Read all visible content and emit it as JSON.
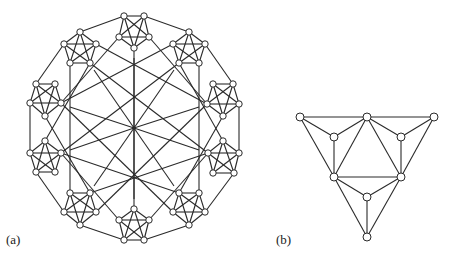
{
  "figure": {
    "panels": [
      {
        "id": "a",
        "label": "(a)",
        "description": "Graph with eight K5 pentagon clusters arranged on a circle, joined by an outer cycle, long chords and twelve spokes meeting at a central vertex",
        "center": [
          134,
          128
        ],
        "clusters": [
          {
            "name": "top",
            "vertices": [
              [
                124,
                16
              ],
              [
                144,
                16
              ],
              [
                119,
                37
              ],
              [
                149,
                37
              ],
              [
                134,
                48
              ]
            ]
          },
          {
            "name": "top-right",
            "vertices": [
              [
                189,
                32
              ],
              [
                173,
                44
              ],
              [
                205,
                44
              ],
              [
                179,
                63
              ],
              [
                199,
                63
              ]
            ]
          },
          {
            "name": "right-upper",
            "vertices": [
              [
                213,
                84
              ],
              [
                233,
                84
              ],
              [
                207,
                104
              ],
              [
                239,
                104
              ],
              [
                223,
                116
              ]
            ]
          },
          {
            "name": "right-lower",
            "vertices": [
              [
                223,
                141
              ],
              [
                208,
                153
              ],
              [
                239,
                153
              ],
              [
                213,
                173
              ],
              [
                234,
                173
              ]
            ]
          },
          {
            "name": "bottom-right",
            "vertices": [
              [
                179,
                193
              ],
              [
                199,
                193
              ],
              [
                173,
                212
              ],
              [
                205,
                212
              ],
              [
                189,
                225
              ]
            ]
          },
          {
            "name": "bottom",
            "vertices": [
              [
                134,
                209
              ],
              [
                119,
                220
              ],
              [
                149,
                220
              ],
              [
                124,
                240
              ],
              [
                144,
                240
              ]
            ]
          },
          {
            "name": "bottom-left",
            "vertices": [
              [
                70,
                193
              ],
              [
                90,
                193
              ],
              [
                64,
                212
              ],
              [
                96,
                212
              ],
              [
                80,
                225
              ]
            ]
          },
          {
            "name": "left-lower",
            "vertices": [
              [
                45,
                141
              ],
              [
                30,
                153
              ],
              [
                61,
                153
              ],
              [
                36,
                172
              ],
              [
                55,
                172
              ]
            ]
          },
          {
            "name": "left-upper",
            "vertices": [
              [
                36,
                84
              ],
              [
                55,
                84
              ],
              [
                30,
                103
              ],
              [
                61,
                103
              ],
              [
                45,
                116
              ]
            ]
          },
          {
            "name": "top-left",
            "vertices": [
              [
                80,
                32
              ],
              [
                64,
                44
              ],
              [
                96,
                44
              ],
              [
                70,
                63
              ],
              [
                90,
                63
              ]
            ]
          }
        ],
        "inner_nodes": [
          [
            134,
            58
          ],
          [
            174,
            70
          ],
          [
            199,
            107
          ],
          [
            199,
            150
          ],
          [
            174,
            186
          ],
          [
            134,
            199
          ],
          [
            94,
            186
          ],
          [
            70,
            150
          ],
          [
            70,
            107
          ],
          [
            94,
            70
          ]
        ]
      },
      {
        "id": "b",
        "label": "(b)",
        "description": "Triangular graph with 9 vertices",
        "vertices": {
          "A": [
            300,
            117
          ],
          "B": [
            367,
            117
          ],
          "C": [
            434,
            117
          ],
          "D": [
            334,
            137
          ],
          "E": [
            401,
            137
          ],
          "F": [
            334,
            177
          ],
          "G": [
            401,
            177
          ],
          "H": [
            367,
            197
          ],
          "I": [
            367,
            237
          ]
        },
        "edges": [
          [
            "A",
            "B"
          ],
          [
            "B",
            "C"
          ],
          [
            "A",
            "D"
          ],
          [
            "D",
            "B"
          ],
          [
            "B",
            "E"
          ],
          [
            "E",
            "C"
          ],
          [
            "A",
            "F"
          ],
          [
            "D",
            "F"
          ],
          [
            "B",
            "F"
          ],
          [
            "B",
            "G"
          ],
          [
            "E",
            "G"
          ],
          [
            "C",
            "G"
          ],
          [
            "F",
            "G"
          ],
          [
            "F",
            "H"
          ],
          [
            "H",
            "G"
          ],
          [
            "F",
            "I"
          ],
          [
            "H",
            "I"
          ],
          [
            "G",
            "I"
          ]
        ]
      }
    ],
    "colors": {
      "stroke": "#2a2a2a",
      "node_fill": "#ffffff",
      "background": "#ffffff"
    }
  }
}
